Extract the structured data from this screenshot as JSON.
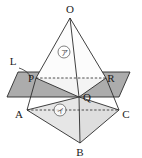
{
  "figure": {
    "background_color": "#ffffff",
    "stroke_color": "#2b2b2b",
    "labels": {
      "apex": "O",
      "plane": "L",
      "section_left": "P",
      "section_right": "R",
      "section_bottom": "Q",
      "base_left": "A",
      "base_right": "C",
      "base_bottom": "B",
      "region_upper": "ア",
      "region_lower": "イ"
    },
    "region_marks": [
      {
        "name": "upper-region-mark",
        "text": "ア",
        "cx": 64,
        "cy": 52,
        "r": 6
      },
      {
        "name": "lower-region-mark",
        "text": "イ",
        "cx": 60,
        "cy": 110,
        "r": 6
      }
    ],
    "vertices": {
      "O": {
        "x": 70,
        "y": 18
      },
      "P": {
        "x": 36,
        "y": 78
      },
      "R": {
        "x": 106,
        "y": 78
      },
      "Q": {
        "x": 79,
        "y": 97
      },
      "A": {
        "x": 27,
        "y": 110
      },
      "C": {
        "x": 119,
        "y": 110
      },
      "B": {
        "x": 80,
        "y": 143
      }
    },
    "label_positions": {
      "O": {
        "x": 70,
        "y": 12
      },
      "L": {
        "x": 14,
        "y": 63
      },
      "P": {
        "x": 33,
        "y": 80
      },
      "R": {
        "x": 110,
        "y": 80
      },
      "Q": {
        "x": 84,
        "y": 99
      },
      "A": {
        "x": 21,
        "y": 117
      },
      "C": {
        "x": 124,
        "y": 117
      },
      "B": {
        "x": 80,
        "y": 155
      }
    },
    "plane": {
      "name": "plane-L",
      "points": "18,72 130,72 119,97 7,97",
      "fill": "#9e9e9e",
      "opacity": 0.85
    },
    "section_triangle": {
      "name": "section-triangle-PQR",
      "points": "36,78 106,78 79,97",
      "fill": "#f2f2f2"
    },
    "lower_face_left": {
      "name": "face-ABQ",
      "points": "27,110 80,143 79,97",
      "fill": "#e3e3e3"
    },
    "lower_face_right": {
      "name": "face-BCQ",
      "points": "80,143 119,110 79,97",
      "fill": "#dcdcdc"
    },
    "upper_face": {
      "name": "face-OPR",
      "points": "70,18 36,78 106,78",
      "fill": "#fbfbfb"
    },
    "solid_edges": [
      {
        "name": "edge-O-P",
        "x1": 70,
        "y1": 18,
        "x2": 36,
        "y2": 78
      },
      {
        "name": "edge-O-R",
        "x1": 70,
        "y1": 18,
        "x2": 106,
        "y2": 78
      },
      {
        "name": "edge-O-Q",
        "x1": 70,
        "y1": 18,
        "x2": 79,
        "y2": 97
      },
      {
        "name": "edge-P-Q",
        "x1": 36,
        "y1": 78,
        "x2": 79,
        "y2": 97
      },
      {
        "name": "edge-R-Q",
        "x1": 106,
        "y1": 78,
        "x2": 79,
        "y2": 97
      },
      {
        "name": "edge-P-A",
        "x1": 36,
        "y1": 78,
        "x2": 27,
        "y2": 110
      },
      {
        "name": "edge-R-C",
        "x1": 106,
        "y1": 78,
        "x2": 119,
        "y2": 110
      },
      {
        "name": "edge-A-B",
        "x1": 27,
        "y1": 110,
        "x2": 80,
        "y2": 143
      },
      {
        "name": "edge-C-B",
        "x1": 119,
        "y1": 110,
        "x2": 80,
        "y2": 143
      },
      {
        "name": "edge-Q-B",
        "x1": 79,
        "y1": 97,
        "x2": 80,
        "y2": 143
      },
      {
        "name": "edge-Q-A",
        "x1": 79,
        "y1": 97,
        "x2": 27,
        "y2": 110
      },
      {
        "name": "edge-Q-C",
        "x1": 79,
        "y1": 97,
        "x2": 119,
        "y2": 110
      }
    ],
    "dashed_edges": [
      {
        "name": "hidden-edge-P-R",
        "x1": 36,
        "y1": 78,
        "x2": 106,
        "y2": 78
      },
      {
        "name": "hidden-edge-A-C",
        "x1": 27,
        "y1": 110,
        "x2": 119,
        "y2": 110
      }
    ],
    "leader_line": {
      "name": "plane-label-leader",
      "path": "M 18 67 C 24 69, 28 72, 30 77"
    }
  }
}
